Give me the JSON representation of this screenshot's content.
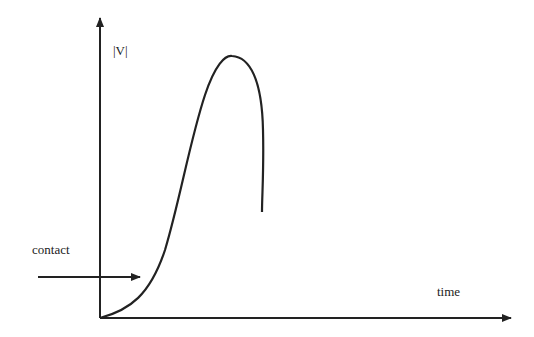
{
  "diagram": {
    "y_axis_label": "|V|",
    "x_axis_label": "time",
    "annotation": "contact",
    "colors": {
      "stroke": "#222222",
      "background": "#ffffff"
    }
  }
}
